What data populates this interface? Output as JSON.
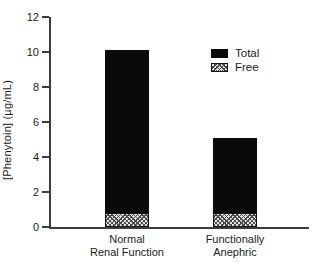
{
  "chart_data": {
    "type": "bar",
    "title": "",
    "xlabel": "",
    "ylabel": "[Phenytoin] (µg/mL)",
    "ylim": [
      0,
      12
    ],
    "yticks": [
      0,
      2,
      4,
      6,
      8,
      10,
      12
    ],
    "grid": false,
    "legend_position": "upper-right",
    "categories": [
      "Normal Renal Function",
      "Functionally Anephric"
    ],
    "category_lines": [
      [
        "Normal",
        "Renal Function"
      ],
      [
        "Functionally",
        "Anephric"
      ]
    ],
    "series": [
      {
        "name": "Total",
        "style": "solid-black",
        "values": [
          10.1,
          5.1
        ]
      },
      {
        "name": "Free",
        "style": "crosshatch",
        "values": [
          0.8,
          0.8
        ]
      }
    ],
    "colors": {
      "total_fill": "#0a0a0a",
      "free_fill": "#e3e3e3",
      "hatch_line": "#4a4a4a",
      "axis": "#3c3c3c",
      "text": "#1a1a1a",
      "background": "#ffffff"
    }
  }
}
